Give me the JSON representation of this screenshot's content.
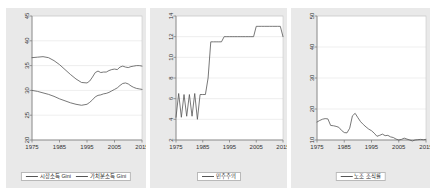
{
  "figure": {
    "background_color": "#ffffff",
    "panel_background_color": "#e9e9e9",
    "plot_background_color": "#ffffff",
    "line_color": "#555555",
    "grid_color": "#dddddd",
    "axis_color": "#808080"
  },
  "chart_data": [
    {
      "type": "line",
      "panel": 1,
      "title": "",
      "xlabel": "",
      "ylabel": "",
      "xlim": [
        1975,
        2015
      ],
      "ylim": [
        20,
        45
      ],
      "xticks": [
        1975,
        1985,
        1995,
        2005,
        2015
      ],
      "yticks": [
        20,
        25,
        30,
        35,
        40,
        45
      ],
      "xticklabels": [
        "1975",
        "1985",
        "1995",
        "2005",
        "2015"
      ],
      "yticklabels": [
        "20",
        "25",
        "30",
        "35",
        "40",
        "45"
      ],
      "grid": true,
      "legend_position": "below",
      "series": [
        {
          "name": "시장소득 Gini",
          "color": "#555555",
          "x": [
            1975,
            1977,
            1979,
            1981,
            1983,
            1985,
            1987,
            1989,
            1991,
            1993,
            1995,
            1996,
            1997,
            1998,
            1999,
            2000,
            2001,
            2002,
            2003,
            2004,
            2005,
            2006,
            2007,
            2008,
            2009,
            2010,
            2011,
            2012,
            2013,
            2014,
            2015
          ],
          "values": [
            36.6,
            36.7,
            36.8,
            36.6,
            36.0,
            35.2,
            34.2,
            33.2,
            32.3,
            31.6,
            31.5,
            31.9,
            32.7,
            33.6,
            33.9,
            33.6,
            33.7,
            33.7,
            34.0,
            34.2,
            34.3,
            34.2,
            34.7,
            34.9,
            34.7,
            34.6,
            34.8,
            34.9,
            35.0,
            35.0,
            34.9
          ]
        },
        {
          "name": "가처분소득 Gini",
          "color": "#555555",
          "x": [
            1975,
            1977,
            1979,
            1981,
            1983,
            1985,
            1987,
            1989,
            1991,
            1993,
            1995,
            1996,
            1997,
            1998,
            1999,
            2000,
            2001,
            2002,
            2003,
            2004,
            2005,
            2006,
            2007,
            2008,
            2009,
            2010,
            2011,
            2012,
            2013,
            2014,
            2015
          ],
          "values": [
            30.0,
            29.8,
            29.5,
            29.2,
            28.8,
            28.3,
            27.9,
            27.5,
            27.2,
            27.0,
            27.2,
            27.6,
            28.1,
            28.7,
            29.0,
            29.1,
            29.3,
            29.4,
            29.6,
            29.9,
            30.2,
            30.5,
            31.0,
            31.4,
            31.5,
            31.3,
            30.9,
            30.6,
            30.4,
            30.3,
            30.2
          ]
        }
      ]
    },
    {
      "type": "line",
      "panel": 2,
      "title": "",
      "xlabel": "",
      "ylabel": "",
      "xlim": [
        1975,
        2015
      ],
      "ylim": [
        2,
        14
      ],
      "xticks": [
        1975,
        1985,
        1995,
        2005,
        2015
      ],
      "yticks": [
        2,
        4,
        6,
        8,
        10,
        12,
        14
      ],
      "xticklabels": [
        "1975",
        "1985",
        "1995",
        "2005",
        "2015"
      ],
      "yticklabels": [
        "2",
        "4",
        "6",
        "8",
        "10",
        "12",
        "14"
      ],
      "grid": true,
      "legend_position": "below",
      "series": [
        {
          "name": "민주주의",
          "color": "#555555",
          "x": [
            1975,
            1976,
            1977,
            1978,
            1979,
            1980,
            1981,
            1982,
            1983,
            1984,
            1985,
            1986,
            1987,
            1988,
            1989,
            1990,
            1991,
            1992,
            1993,
            1994,
            1995,
            1996,
            1997,
            1998,
            1999,
            2000,
            2001,
            2002,
            2003,
            2004,
            2005,
            2006,
            2007,
            2008,
            2009,
            2010,
            2011,
            2012,
            2013,
            2014,
            2015
          ],
          "values": [
            4.2,
            6.5,
            4.2,
            6.4,
            4.3,
            6.4,
            4.3,
            6.5,
            4.0,
            6.4,
            6.4,
            6.4,
            8.0,
            11.5,
            11.5,
            11.5,
            11.5,
            11.5,
            12.0,
            12.0,
            12.0,
            12.0,
            12.0,
            12.0,
            12.0,
            12.0,
            12.0,
            12.0,
            12.0,
            12.0,
            13.0,
            13.0,
            13.0,
            13.0,
            13.0,
            13.0,
            13.0,
            13.0,
            13.0,
            13.0,
            12.0
          ]
        }
      ]
    },
    {
      "type": "line",
      "panel": 3,
      "title": "",
      "xlabel": "",
      "ylabel": "",
      "xlim": [
        1975,
        2015
      ],
      "ylim": [
        10,
        50
      ],
      "xticks": [
        1975,
        1985,
        1995,
        2005,
        2015
      ],
      "yticks": [
        10,
        20,
        30,
        40,
        50
      ],
      "xticklabels": [
        "1975",
        "1985",
        "1995",
        "2005",
        "2015"
      ],
      "yticklabels": [
        "10",
        "20",
        "30",
        "40",
        "50"
      ],
      "grid": true,
      "legend_position": "below",
      "series": [
        {
          "name": "노조 조직률",
          "color": "#555555",
          "x": [
            1975,
            1976,
            1977,
            1978,
            1979,
            1980,
            1981,
            1982,
            1983,
            1984,
            1985,
            1986,
            1987,
            1988,
            1989,
            1990,
            1991,
            1992,
            1993,
            1994,
            1995,
            1996,
            1997,
            1998,
            1999,
            2000,
            2001,
            2002,
            2003,
            2004,
            2005,
            2006,
            2007,
            2008,
            2009,
            2010,
            2011,
            2012,
            2013,
            2014,
            2015
          ],
          "values": [
            15.8,
            16.3,
            16.7,
            16.9,
            16.8,
            14.7,
            14.6,
            14.4,
            14.1,
            13.1,
            12.4,
            12.3,
            13.8,
            17.8,
            18.6,
            17.2,
            15.9,
            15.0,
            14.2,
            13.5,
            13.0,
            12.2,
            11.2,
            11.5,
            11.9,
            11.4,
            11.5,
            11.0,
            10.8,
            10.3,
            10.0,
            10.2,
            10.6,
            10.3,
            10.0,
            9.7,
            10.0,
            10.1,
            10.2,
            10.1,
            10.2
          ]
        }
      ]
    }
  ],
  "panel1": {
    "legend": [
      {
        "label": "시장소득 Gini"
      },
      {
        "label": "가처분소득 Gini"
      }
    ]
  },
  "panel2": {
    "legend": [
      {
        "label": "민주주의"
      }
    ]
  },
  "panel3": {
    "legend": [
      {
        "label": "노조 조직률"
      }
    ]
  }
}
